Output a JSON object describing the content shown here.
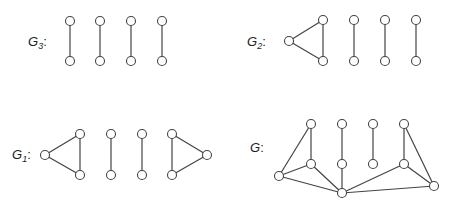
{
  "graphs": [
    {
      "id": "G3",
      "label": "G",
      "subscript": "3",
      "suffix": ":",
      "label_pos": [
        28,
        46
      ],
      "nodes": [
        [
          70,
          21
        ],
        [
          70,
          61
        ],
        [
          100,
          21
        ],
        [
          100,
          61
        ],
        [
          131,
          21
        ],
        [
          131,
          61
        ],
        [
          162,
          21
        ],
        [
          162,
          61
        ]
      ],
      "edges": [
        [
          0,
          1
        ],
        [
          2,
          3
        ],
        [
          4,
          5
        ],
        [
          6,
          7
        ]
      ]
    },
    {
      "id": "G2",
      "label": "G",
      "subscript": "2",
      "suffix": ":",
      "label_pos": [
        247,
        46
      ],
      "nodes": [
        [
          289,
          41
        ],
        [
          323,
          20
        ],
        [
          323,
          61
        ],
        [
          354,
          20
        ],
        [
          354,
          61
        ],
        [
          385,
          20
        ],
        [
          385,
          61
        ],
        [
          416,
          20
        ],
        [
          416,
          61
        ]
      ],
      "edges": [
        [
          0,
          1
        ],
        [
          0,
          2
        ],
        [
          1,
          2
        ],
        [
          3,
          4
        ],
        [
          5,
          6
        ],
        [
          7,
          8
        ]
      ]
    },
    {
      "id": "G1",
      "label": "G",
      "subscript": "1",
      "suffix": ":",
      "label_pos": [
        12,
        159
      ],
      "nodes": [
        [
          45,
          155
        ],
        [
          80,
          134
        ],
        [
          80,
          175
        ],
        [
          111,
          134
        ],
        [
          111,
          175
        ],
        [
          142,
          134
        ],
        [
          142,
          175
        ],
        [
          172,
          134
        ],
        [
          172,
          175
        ],
        [
          207,
          155
        ]
      ],
      "edges": [
        [
          0,
          1
        ],
        [
          0,
          2
        ],
        [
          1,
          2
        ],
        [
          3,
          4
        ],
        [
          5,
          6
        ],
        [
          7,
          8
        ],
        [
          7,
          9
        ],
        [
          8,
          9
        ]
      ]
    },
    {
      "id": "G",
      "label": "G",
      "subscript": "",
      "suffix": ":",
      "label_pos": [
        250,
        152
      ],
      "nodes": [
        [
          311,
          124
        ],
        [
          342,
          124
        ],
        [
          373,
          124
        ],
        [
          404,
          124
        ],
        [
          311,
          164
        ],
        [
          342,
          164
        ],
        [
          373,
          164
        ],
        [
          404,
          164
        ],
        [
          279,
          176
        ],
        [
          342,
          193
        ],
        [
          434,
          186
        ]
      ],
      "edges": [
        [
          0,
          4
        ],
        [
          1,
          5
        ],
        [
          2,
          6
        ],
        [
          3,
          7
        ],
        [
          0,
          8
        ],
        [
          3,
          10
        ],
        [
          8,
          4
        ],
        [
          8,
          9
        ],
        [
          4,
          9
        ],
        [
          5,
          9
        ],
        [
          7,
          9
        ],
        [
          7,
          10
        ],
        [
          9,
          10
        ]
      ]
    }
  ],
  "style": {
    "stroke": "#444444",
    "node_fill": "#ffffff",
    "node_radius": 4.5
  }
}
